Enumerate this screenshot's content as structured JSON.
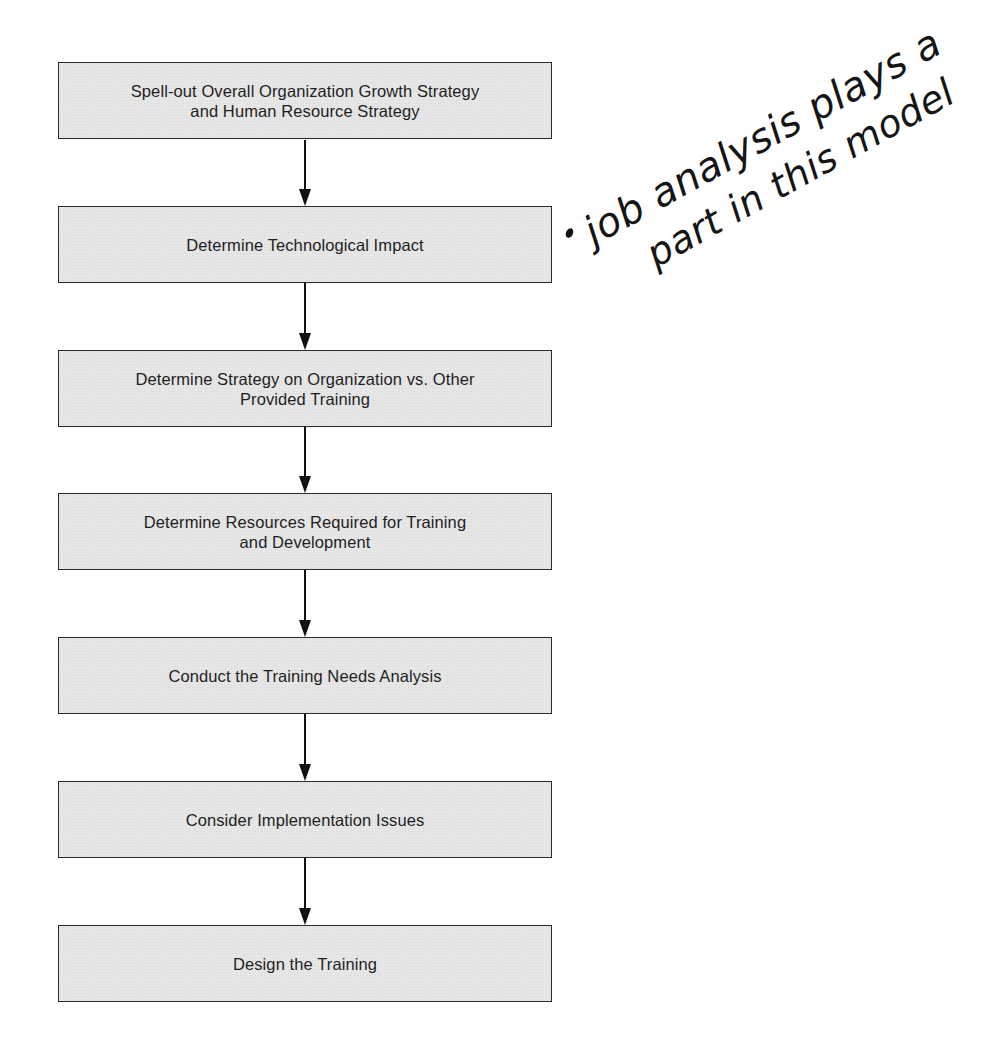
{
  "diagram": {
    "type": "vertical-flowchart",
    "boxes": [
      {
        "label": "Spell-out Overall Organization Growth Strategy\nand Human Resource Strategy"
      },
      {
        "label": "Determine Technological Impact"
      },
      {
        "label": "Determine Strategy on Organization vs. Other\nProvided Training"
      },
      {
        "label": "Determine Resources Required for Training\nand Development"
      },
      {
        "label": "Conduct the Training Needs Analysis"
      },
      {
        "label": "Consider Implementation Issues"
      },
      {
        "label": "Design the Training"
      }
    ],
    "arrows": [
      {
        "from": 0,
        "to": 1
      },
      {
        "from": 1,
        "to": 2
      },
      {
        "from": 2,
        "to": 3
      },
      {
        "from": 3,
        "to": 4
      },
      {
        "from": 4,
        "to": 5
      },
      {
        "from": 5,
        "to": 6
      }
    ],
    "colors": {
      "box_fill": "#e6e6e6",
      "box_border": "#2a2a2a",
      "text": "#1e1e1e",
      "arrow": "#111111"
    }
  },
  "annotation": {
    "bullet": "•",
    "line1": "job analysis plays a",
    "line2": "part in this model"
  }
}
